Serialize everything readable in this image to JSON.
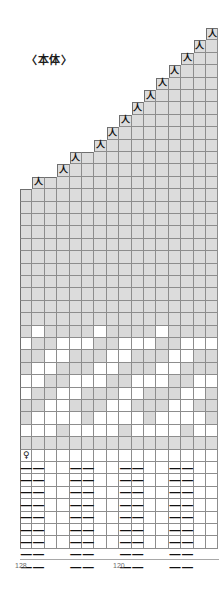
{
  "chart": {
    "title": "〈本体〉",
    "type": "knitting-chart",
    "grid": {
      "columns": 16,
      "rows": 42,
      "cell_width": 12.4,
      "cell_height": 12.4,
      "origin_x": 20,
      "origin_y": 28
    },
    "colors": {
      "main_yarn": "#d9d9d9",
      "contrast_yarn": "#ffffff",
      "grid_line": "#8d8d8d",
      "border": "#6f6f6f",
      "symbol": "#111111",
      "label": "#6b6b6b"
    },
    "symbols": {
      "decrease": "人",
      "purl": "—",
      "twist": "♀"
    },
    "symbol_names": {
      "decrease": "left-slanting-decrease",
      "purl": "purl-stitch",
      "twist": "twisted-stitch"
    },
    "sections": [
      {
        "name": "shoulder-shaping",
        "rows": 12,
        "note": "stepped decrease staircase"
      },
      {
        "name": "plain-stockinette",
        "rows": 11
      },
      {
        "name": "colorwork-motif",
        "rows": 9
      },
      {
        "name": "transition-row",
        "rows": 1
      },
      {
        "name": "ribbing-2x2",
        "rows": 9
      }
    ],
    "stitch_counts": [
      {
        "label": "128",
        "position": "left"
      },
      {
        "label": "120",
        "position": "center"
      }
    ],
    "decrease_steps": [
      {
        "row": 0,
        "col": 15
      },
      {
        "row": 1,
        "col": 14
      },
      {
        "row": 2,
        "col": 13
      },
      {
        "row": 3,
        "col": 12
      },
      {
        "row": 4,
        "col": 11
      },
      {
        "row": 5,
        "col": 10
      },
      {
        "row": 6,
        "col": 9
      },
      {
        "row": 7,
        "col": 8
      },
      {
        "row": 8,
        "col": 7
      },
      {
        "row": 9,
        "col": 6
      },
      {
        "row": 10,
        "col": 4
      },
      {
        "row": 11,
        "col": 3
      },
      {
        "row": 12,
        "col": 1
      }
    ],
    "colorwork_rows": [
      {
        "row": 24,
        "white_cols": [
          1,
          6,
          11
        ]
      },
      {
        "row": 25,
        "white_cols": [
          0,
          3,
          4,
          5,
          8,
          9,
          10,
          13,
          14,
          15
        ]
      },
      {
        "row": 26,
        "white_cols": [
          2,
          3,
          7,
          8,
          12,
          13
        ]
      },
      {
        "row": 27,
        "white_cols": [
          1,
          2,
          6,
          7,
          11,
          12
        ]
      },
      {
        "row": 28,
        "white_cols": [
          0,
          1,
          4,
          5,
          6,
          9,
          10,
          11,
          14,
          15
        ]
      },
      {
        "row": 29,
        "white_cols": [
          0,
          3,
          4,
          8,
          9,
          13,
          14
        ]
      },
      {
        "row": 30,
        "white_cols": [
          2,
          3,
          7,
          8,
          12,
          13
        ]
      },
      {
        "row": 31,
        "white_cols": [
          1,
          2,
          3,
          4,
          6,
          7,
          8,
          9,
          11,
          12,
          13,
          14
        ]
      },
      {
        "row": 32,
        "white_cols": [
          0,
          1,
          2,
          4,
          5,
          6,
          7,
          9,
          10,
          11,
          12,
          14,
          15
        ]
      }
    ],
    "twist_marker": {
      "row": 34,
      "col": 0
    },
    "ribbing": {
      "first_row": 35,
      "row_count": 9,
      "purl_pattern": [
        0,
        1,
        4,
        5,
        8,
        9,
        12,
        13
      ],
      "repeat": "k2 p2"
    }
  }
}
